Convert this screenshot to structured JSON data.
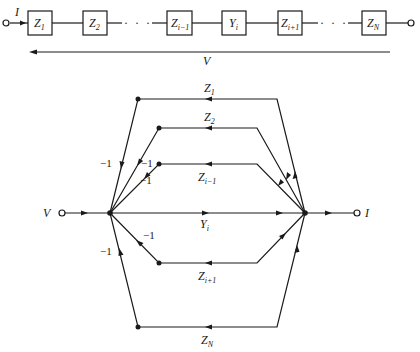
{
  "ladder": {
    "input_current": "I",
    "voltage": "V",
    "ellipsis": "· · ·",
    "elements": [
      {
        "base": "Z",
        "sub": "1"
      },
      {
        "base": "Z",
        "sub": "2"
      },
      {
        "base": "Z",
        "sub": "i−1"
      },
      {
        "base": "Y",
        "sub": "i"
      },
      {
        "base": "Z",
        "sub": "i+1"
      },
      {
        "base": "Z",
        "sub": "N"
      }
    ]
  },
  "flow_graph": {
    "input_label": "V",
    "output_label": "I",
    "branches": [
      {
        "base": "Z",
        "sub": "1"
      },
      {
        "base": "Z",
        "sub": "2"
      },
      {
        "base": "Z",
        "sub": "i−1"
      },
      {
        "base": "Y",
        "sub": "i"
      },
      {
        "base": "Z",
        "sub": "i+1"
      },
      {
        "base": "Z",
        "sub": "N"
      }
    ],
    "feedback_gain": "−1",
    "gains": [
      "−1",
      "−1",
      "−1",
      "−1",
      "−1"
    ]
  }
}
